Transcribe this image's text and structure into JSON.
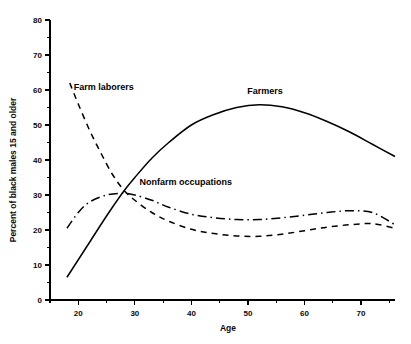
{
  "chart_data": {
    "type": "line",
    "title": "",
    "xlabel": "Age",
    "ylabel": "Percent of black males 15 and older",
    "xlim": [
      15,
      76
    ],
    "ylim": [
      0,
      80
    ],
    "grid": false,
    "legend_position": "inline-annotations",
    "xticks": [
      20,
      30,
      40,
      50,
      60,
      70
    ],
    "xtick_labels": [
      "20",
      "30",
      "40",
      "50",
      "60",
      "70"
    ],
    "xminor_ticks": [
      15,
      25,
      35,
      45,
      55,
      65,
      75
    ],
    "yticks": [
      0,
      10,
      20,
      30,
      40,
      50,
      60,
      70,
      80
    ],
    "ytick_labels": [
      "0",
      "10",
      "20",
      "30",
      "40",
      "50",
      "60",
      "70",
      "80"
    ],
    "yminor_ticks": [
      5,
      15,
      25,
      35,
      45,
      55,
      65,
      75
    ],
    "series": [
      {
        "name": "Farmers",
        "style": "solid",
        "label_x": 53,
        "label_y": 59,
        "x": [
          18,
          20,
          22,
          25,
          28,
          30,
          33,
          36,
          40,
          44,
          48,
          52,
          56,
          60,
          64,
          68,
          72,
          76
        ],
        "values": [
          6.5,
          11.5,
          16.5,
          24.0,
          31.0,
          35.0,
          40.5,
          45.0,
          50.0,
          53.0,
          55.0,
          55.8,
          55.2,
          53.5,
          51.0,
          48.0,
          44.5,
          41.0
        ]
      },
      {
        "name": "Farm laborers",
        "style": "dashed",
        "label_x": 24.5,
        "label_y": 60,
        "x": [
          18.5,
          20,
          22,
          24,
          26,
          28,
          30,
          33,
          36,
          40,
          44,
          48,
          52,
          56,
          60,
          64,
          68,
          72,
          76
        ],
        "values": [
          62.0,
          56.0,
          48.5,
          42.0,
          36.0,
          31.5,
          28.5,
          25.0,
          22.5,
          20.2,
          19.0,
          18.3,
          18.2,
          18.8,
          19.8,
          20.8,
          21.5,
          21.8,
          20.5
        ]
      },
      {
        "name": "Nonfarm occupations",
        "style": "dashdot",
        "label_x": 39,
        "label_y": 33,
        "x": [
          18,
          20,
          22,
          25,
          28,
          30,
          33,
          36,
          40,
          44,
          48,
          52,
          56,
          60,
          64,
          68,
          72,
          76
        ],
        "values": [
          20.5,
          25.0,
          28.0,
          30.0,
          30.5,
          30.0,
          28.5,
          26.5,
          24.5,
          23.5,
          23.0,
          23.0,
          23.5,
          24.2,
          25.0,
          25.5,
          25.0,
          21.5
        ]
      }
    ]
  }
}
